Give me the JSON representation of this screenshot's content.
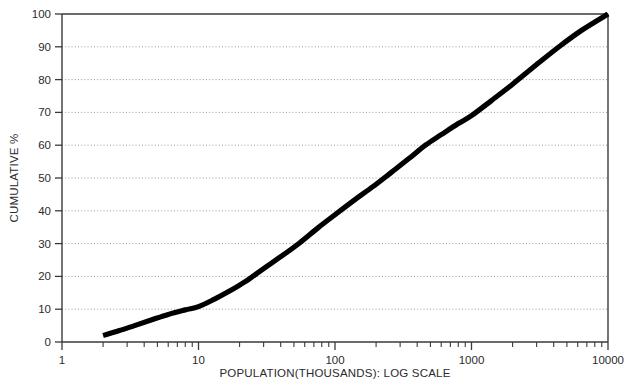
{
  "chart_data": {
    "type": "line",
    "title": "",
    "xlabel": "POPULATION(THOUSANDS): LOG SCALE",
    "ylabel": "CUMULATIVE %",
    "xscale": "log",
    "xlim": [
      1,
      10000
    ],
    "ylim": [
      0,
      100
    ],
    "grid": true,
    "legend": null,
    "x_tick_labels": [
      "1",
      "10",
      "100",
      "1000",
      "10000"
    ],
    "x_tick_values": [
      1,
      10,
      100,
      1000,
      10000
    ],
    "x_minor_ticks": [
      2,
      3,
      4,
      5,
      6,
      7,
      8,
      9,
      20,
      30,
      40,
      50,
      60,
      70,
      80,
      90,
      200,
      300,
      400,
      500,
      600,
      700,
      800,
      900,
      2000,
      3000,
      4000,
      5000,
      6000,
      7000,
      8000,
      9000
    ],
    "y_tick_labels": [
      "0",
      "10",
      "20",
      "30",
      "40",
      "50",
      "60",
      "70",
      "80",
      "90",
      "100"
    ],
    "y_tick_values": [
      0,
      10,
      20,
      30,
      40,
      50,
      60,
      70,
      80,
      90,
      100
    ],
    "series": [
      {
        "name": "Cumulative distribution",
        "color": "#000000",
        "x": [
          2.0,
          2.6,
          3.4,
          4.5,
          6.0,
          8.0,
          10.0,
          13.0,
          17.0,
          22.0,
          30.0,
          40.0,
          55.0,
          75.0,
          100.0,
          140.0,
          190.0,
          260.0,
          350.0,
          460.0,
          600.0,
          800.0,
          1000.0,
          1400.0,
          2000.0,
          3000.0,
          4500.0,
          6500.0,
          10000.0
        ],
        "y": [
          2.0,
          3.4,
          5.0,
          6.7,
          8.4,
          9.8,
          10.8,
          13.0,
          15.6,
          18.4,
          22.4,
          26.0,
          30.2,
          34.8,
          38.8,
          43.4,
          47.4,
          51.8,
          56.0,
          60.0,
          63.2,
          66.6,
          69.0,
          73.6,
          78.6,
          84.6,
          90.4,
          95.2,
          100.0
        ]
      }
    ]
  },
  "plot_geometry": {
    "left": 62,
    "right": 608,
    "top": 14,
    "bottom": 342
  },
  "colors": {
    "axis": "#3a3a3a",
    "grid": "#8c8c8c",
    "curve": "#000000",
    "text": "#2b2b2b",
    "background": "#ffffff"
  }
}
